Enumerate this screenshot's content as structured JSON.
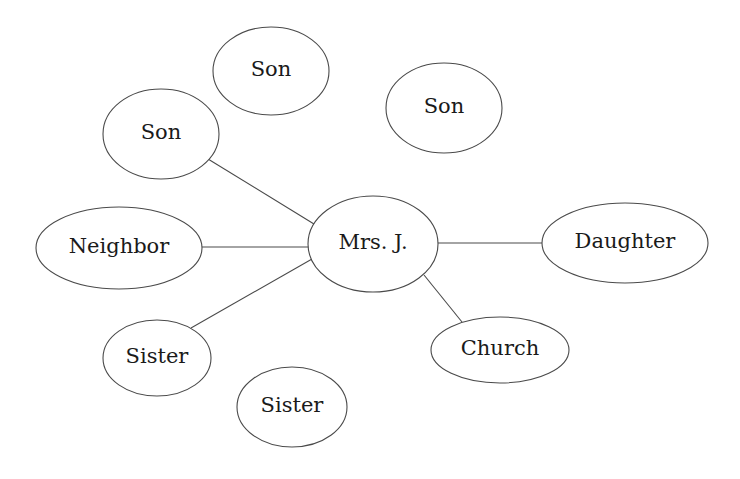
{
  "diagram": {
    "type": "social-network-ego-map",
    "colors": {
      "background": "#ffffff",
      "stroke": "#4a4a4a",
      "text": "#1a1a1a"
    },
    "center_node": "mrs-j",
    "nodes": [
      {
        "id": "son-top",
        "label": "Son",
        "cx": 271,
        "cy": 71,
        "rx": 58,
        "ry": 44,
        "connected": false
      },
      {
        "id": "son-left",
        "label": "Son",
        "cx": 161,
        "cy": 134,
        "rx": 58,
        "ry": 45,
        "connected": true
      },
      {
        "id": "son-right",
        "label": "Son",
        "cx": 444,
        "cy": 108,
        "rx": 58,
        "ry": 45,
        "connected": false
      },
      {
        "id": "neighbor",
        "label": "Neighbor",
        "cx": 119,
        "cy": 248,
        "rx": 83,
        "ry": 41,
        "connected": true
      },
      {
        "id": "mrs-j",
        "label": "Mrs. J.",
        "cx": 373,
        "cy": 244,
        "rx": 65,
        "ry": 48,
        "connected": true
      },
      {
        "id": "daughter",
        "label": "Daughter",
        "cx": 625,
        "cy": 243,
        "rx": 83,
        "ry": 40,
        "connected": true
      },
      {
        "id": "sister-left",
        "label": "Sister",
        "cx": 157,
        "cy": 358,
        "rx": 54,
        "ry": 38,
        "connected": true
      },
      {
        "id": "sister-bottom",
        "label": "Sister",
        "cx": 292,
        "cy": 407,
        "rx": 55,
        "ry": 40,
        "connected": false
      },
      {
        "id": "church",
        "label": "Church",
        "cx": 500,
        "cy": 350,
        "rx": 69,
        "ry": 33,
        "connected": true
      }
    ],
    "edges": [
      {
        "from": "son-left",
        "to": "mrs-j",
        "x1": 208,
        "y1": 159,
        "x2": 314,
        "y2": 224
      },
      {
        "from": "neighbor",
        "to": "mrs-j",
        "x1": 202,
        "y1": 247,
        "x2": 309,
        "y2": 247
      },
      {
        "from": "sister-left",
        "to": "mrs-j",
        "x1": 191,
        "y1": 328,
        "x2": 312,
        "y2": 259
      },
      {
        "from": "mrs-j",
        "to": "daughter",
        "x1": 438,
        "y1": 243,
        "x2": 543,
        "y2": 243
      },
      {
        "from": "mrs-j",
        "to": "church",
        "x1": 424,
        "y1": 275,
        "x2": 462,
        "y2": 322
      }
    ]
  }
}
